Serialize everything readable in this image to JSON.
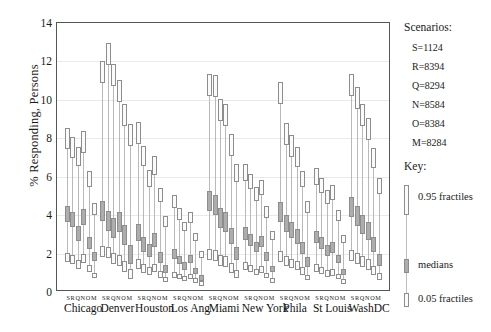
{
  "chart_data": {
    "type": "box",
    "title": "",
    "xlabel": "",
    "ylabel": "% Responding, Persons",
    "ylim": [
      0,
      14
    ],
    "yticks": [
      0,
      2,
      4,
      6,
      8,
      10,
      12,
      14
    ],
    "grid": true,
    "scenario_order": [
      "S",
      "R",
      "Q",
      "N",
      "O",
      "M"
    ],
    "box_parts": [
      "0.05 fractile (lower box)",
      "median (dark box)",
      "0.95 fractile (upper box)"
    ],
    "categories": [
      "Chicago",
      "Denver",
      "Houston",
      "Los Ang",
      "Miami",
      "New York",
      "Phila",
      "St Louis",
      "WashDC"
    ],
    "groups": [
      {
        "city": "Chicago",
        "series": [
          {
            "scenario": "S",
            "p05": 1.45,
            "median": 3.95,
            "p95": 8.45
          },
          {
            "scenario": "R",
            "p05": 1.35,
            "median": 3.65,
            "p95": 7.95
          },
          {
            "scenario": "Q",
            "p05": 1.1,
            "median": 2.95,
            "p95": 7.45
          },
          {
            "scenario": "N",
            "p05": 1.4,
            "median": 3.8,
            "p95": 8.25
          },
          {
            "scenario": "O",
            "p05": 0.95,
            "median": 2.45,
            "p95": 6.2
          },
          {
            "scenario": "M",
            "p05": 0.6,
            "median": 1.75,
            "p95": 4.55
          }
        ]
      },
      {
        "city": "Denver",
        "series": [
          {
            "scenario": "S",
            "p05": 1.7,
            "median": 4.1,
            "p95": 11.9
          },
          {
            "scenario": "R",
            "p05": 1.65,
            "median": 3.6,
            "p95": 12.85
          },
          {
            "scenario": "Q",
            "p05": 1.35,
            "median": 3.25,
            "p95": 11.75
          },
          {
            "scenario": "N",
            "p05": 1.25,
            "median": 3.55,
            "p95": 10.95
          },
          {
            "scenario": "O",
            "p05": 0.95,
            "median": 2.85,
            "p95": 9.7
          },
          {
            "scenario": "M",
            "p05": 0.55,
            "median": 1.85,
            "p95": 8.65
          }
        ]
      },
      {
        "city": "Houston",
        "series": [
          {
            "scenario": "S",
            "p05": 1.1,
            "median": 3.0,
            "p95": 8.75
          },
          {
            "scenario": "R",
            "p05": 0.9,
            "median": 2.35,
            "p95": 7.5
          },
          {
            "scenario": "Q",
            "p05": 0.8,
            "median": 2.05,
            "p95": 6.25
          },
          {
            "scenario": "N",
            "p05": 0.95,
            "median": 2.6,
            "p95": 6.95
          },
          {
            "scenario": "O",
            "p05": 0.65,
            "median": 1.7,
            "p95": 5.3
          },
          {
            "scenario": "M",
            "p05": 0.4,
            "median": 1.1,
            "p95": 3.85
          }
        ]
      },
      {
        "city": "Los Ang",
        "series": [
          {
            "scenario": "S",
            "p05": 0.65,
            "median": 1.85,
            "p95": 4.95
          },
          {
            "scenario": "R",
            "p05": 0.55,
            "median": 1.55,
            "p95": 4.25
          },
          {
            "scenario": "Q",
            "p05": 0.45,
            "median": 1.25,
            "p95": 3.55
          },
          {
            "scenario": "N",
            "p05": 0.55,
            "median": 1.6,
            "p95": 4.05
          },
          {
            "scenario": "O",
            "p05": 0.35,
            "median": 1.0,
            "p95": 2.95
          },
          {
            "scenario": "M",
            "p05": 0.2,
            "median": 0.65,
            "p95": 2.05
          }
        ]
      },
      {
        "city": "Miami",
        "series": [
          {
            "scenario": "S",
            "p05": 1.55,
            "median": 4.65,
            "p95": 11.25
          },
          {
            "scenario": "R",
            "p05": 1.5,
            "median": 4.4,
            "p95": 11.2
          },
          {
            "scenario": "Q",
            "p05": 1.25,
            "median": 3.75,
            "p95": 9.95
          },
          {
            "scenario": "N",
            "p05": 1.2,
            "median": 3.55,
            "p95": 9.7
          },
          {
            "scenario": "O",
            "p05": 0.9,
            "median": 2.8,
            "p95": 8.1
          },
          {
            "scenario": "M",
            "p05": 0.6,
            "median": 1.9,
            "p95": 6.55
          }
        ]
      },
      {
        "city": "New York",
        "series": [
          {
            "scenario": "S",
            "p05": 1.05,
            "median": 2.95,
            "p95": 6.55
          },
          {
            "scenario": "R",
            "p05": 0.95,
            "median": 2.6,
            "p95": 6.05
          },
          {
            "scenario": "Q",
            "p05": 0.8,
            "median": 2.25,
            "p95": 5.35
          },
          {
            "scenario": "N",
            "p05": 0.9,
            "median": 2.5,
            "p95": 5.7
          },
          {
            "scenario": "O",
            "p05": 0.6,
            "median": 1.75,
            "p95": 4.35
          },
          {
            "scenario": "M",
            "p05": 0.35,
            "median": 1.1,
            "p95": 3.05
          }
        ]
      },
      {
        "city": "Phila",
        "series": [
          {
            "scenario": "S",
            "p05": 1.45,
            "median": 4.05,
            "p95": 10.85
          },
          {
            "scenario": "R",
            "p05": 1.25,
            "median": 3.45,
            "p95": 8.7
          },
          {
            "scenario": "Q",
            "p05": 1.15,
            "median": 3.1,
            "p95": 8.05
          },
          {
            "scenario": "N",
            "p05": 1.05,
            "median": 2.8,
            "p95": 7.45
          },
          {
            "scenario": "O",
            "p05": 0.8,
            "median": 2.2,
            "p95": 6.2
          },
          {
            "scenario": "M",
            "p05": 0.5,
            "median": 1.45,
            "p95": 4.65
          }
        ]
      },
      {
        "city": "St Louis",
        "series": [
          {
            "scenario": "S",
            "p05": 0.95,
            "median": 2.75,
            "p95": 6.35
          },
          {
            "scenario": "R",
            "p05": 0.85,
            "median": 2.45,
            "p95": 5.85
          },
          {
            "scenario": "Q",
            "p05": 0.7,
            "median": 2.05,
            "p95": 5.2
          },
          {
            "scenario": "N",
            "p05": 0.75,
            "median": 2.2,
            "p95": 5.45
          },
          {
            "scenario": "O",
            "p05": 0.55,
            "median": 1.6,
            "p95": 4.15
          },
          {
            "scenario": "M",
            "p05": 0.3,
            "median": 0.95,
            "p95": 2.85
          }
        ]
      },
      {
        "city": "WashDC",
        "series": [
          {
            "scenario": "S",
            "p05": 1.5,
            "median": 4.3,
            "p95": 11.25
          },
          {
            "scenario": "R",
            "p05": 1.35,
            "median": 3.85,
            "p95": 10.55
          },
          {
            "scenario": "Q",
            "p05": 1.2,
            "median": 3.4,
            "p95": 9.7
          },
          {
            "scenario": "N",
            "p05": 1.05,
            "median": 3.05,
            "p95": 8.95
          },
          {
            "scenario": "O",
            "p05": 0.8,
            "median": 2.35,
            "p95": 7.4
          },
          {
            "scenario": "M",
            "p05": 0.5,
            "median": 1.55,
            "p95": 5.85
          }
        ]
      }
    ]
  },
  "axis": {
    "y_title": "% Responding, Persons",
    "y_ticks": [
      "0",
      "2",
      "4",
      "6",
      "8",
      "10",
      "12",
      "14"
    ],
    "scenario_letters": "S R Q N O M"
  },
  "legend": {
    "scenarios_heading": "Scenarios:",
    "scenarios": [
      {
        "label": "S=1124"
      },
      {
        "label": "R=8394"
      },
      {
        "label": "Q=8294"
      },
      {
        "label": "N=8584"
      },
      {
        "label": "O=8384"
      },
      {
        "label": "M=8284"
      }
    ],
    "key_heading": "Key:",
    "key_upper": "0.95 fractiles",
    "key_median": "medians",
    "key_lower": "0.05 fractiles"
  },
  "colors": {
    "axis": "#555555",
    "grid": "#e9e9e9",
    "box_stroke": "#8d8d8d",
    "box_fill": "#fbfbfb",
    "median_fill": "#adadad",
    "whisker": "#bdbdbd",
    "text": "#1a1a1a"
  }
}
